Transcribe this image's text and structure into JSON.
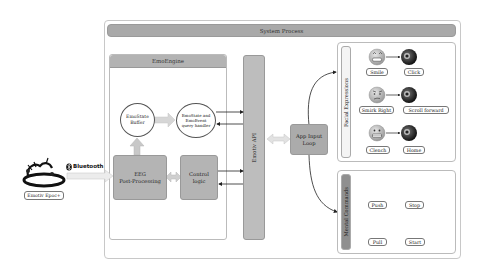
{
  "system_process": {
    "title": "System Process"
  },
  "emoengine": {
    "title": "EmoEngine",
    "emostate_buffer": "EmoState Buffer",
    "emostate_buffer_lines": [
      "EmoState",
      "Buffer"
    ],
    "query_handler_lines": [
      "EmoState and",
      "EmoEvent",
      "query handler"
    ],
    "eeg_lines": [
      "EEG",
      "Post-Processing"
    ],
    "control_lines": [
      "Control",
      "logic"
    ]
  },
  "emotiv_api": {
    "label": "Emotiv API"
  },
  "app_input_loop": {
    "lines": [
      "App Input",
      "Loop"
    ]
  },
  "headset": {
    "label": "Emotiv Epoc+",
    "link": "Bluetooth"
  },
  "facial_expressions": {
    "title": "Facial Expressions",
    "rows": [
      {
        "expression": "Smile",
        "action": "Click",
        "icon": "smile-emoji"
      },
      {
        "expression": "Smirk Right",
        "action": "Scroll forward",
        "icon": "smirk-emoji"
      },
      {
        "expression": "Clench",
        "action": "Home",
        "icon": "clench-emoji"
      }
    ]
  },
  "mental_commands": {
    "title": "Mental Commands",
    "rows": [
      {
        "command": "Push",
        "action": "Stop",
        "icon": "brain-icon"
      },
      {
        "command": "Pull",
        "action": "Start",
        "icon": "brain-icon"
      }
    ]
  },
  "colors": {
    "header_gray": "#a9a9a9",
    "box_gray": "#b4b4b4",
    "mental_tab": "#8f8f8f",
    "arrow_light": "#d9d9d9",
    "line_dark": "#222222"
  }
}
